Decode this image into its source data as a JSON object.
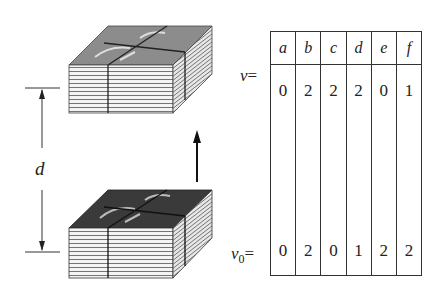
{
  "diagram": {
    "distance_label": "d",
    "row_labels": {
      "v": "v",
      "v_eq": "=",
      "v0": "v",
      "v0_sub": "0",
      "v0_eq": "="
    },
    "table": {
      "columns": [
        "a",
        "b",
        "c",
        "d",
        "e",
        "f"
      ],
      "v": [
        "0",
        "2",
        "2",
        "2",
        "0",
        "1"
      ],
      "v0": [
        "0",
        "2",
        "0",
        "1",
        "2",
        "2"
      ]
    },
    "stacks": {
      "top": "light-paper-stack",
      "bottom": "dark-paper-stack"
    },
    "colors": {
      "line": "#333333",
      "paper_light": "#f2f2f2",
      "top_face_light": "#8a8a8a",
      "top_face_dark": "#3a3a3a"
    }
  }
}
